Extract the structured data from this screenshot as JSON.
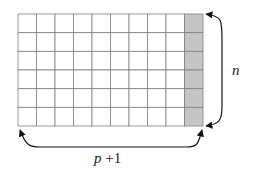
{
  "diagram": {
    "grid": {
      "columns": 10,
      "rows": 6,
      "shaded_column_index": 9,
      "shaded_color": "#c6c6c6",
      "line_color": "#808080"
    },
    "labels": {
      "rows_label": "n",
      "cols_label_var": "p",
      "cols_label_rest": " +1"
    }
  }
}
